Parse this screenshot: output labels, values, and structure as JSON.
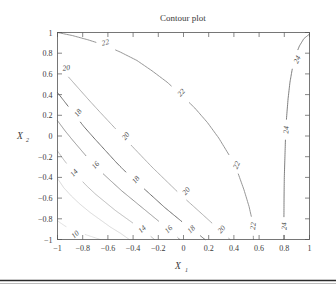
{
  "figure": {
    "title": "Contour plot",
    "background_color": "#ffffff",
    "frame_color": "#555555"
  },
  "chart_data": {
    "type": "contour",
    "title": "Contour plot",
    "xlabel": "X",
    "xlabel_sub": "1",
    "ylabel": "X",
    "ylabel_sub": "2",
    "xlim": [
      -1,
      1
    ],
    "ylim": [
      -1,
      1
    ],
    "grid": false,
    "legend": "none",
    "xticks": [
      "-1",
      "-0.8",
      "-0.6",
      "-0.4",
      "-0.2",
      "0",
      "0.2",
      "0.4",
      "0.6",
      "0.8",
      "1"
    ],
    "xtick_values": [
      -1,
      -0.8,
      -0.6,
      -0.4,
      -0.2,
      0,
      0.2,
      0.4,
      0.6,
      0.8,
      1
    ],
    "yticks": [
      "1",
      "0.8",
      "0.6",
      "0.4",
      "0.2",
      "0",
      "-0.2",
      "-0.4",
      "-0.6",
      "-0.8",
      "-1"
    ],
    "ytick_values": [
      1,
      0.8,
      0.6,
      0.4,
      0.2,
      0,
      -0.2,
      -0.4,
      -0.6,
      -0.8,
      -1
    ],
    "levels": [
      10,
      12,
      14,
      16,
      18,
      20,
      22,
      24
    ],
    "level_colors": [
      "#d8d8d8",
      "#cfcfcf",
      "#a8a8a8",
      "#8a8a8a",
      "#6e6e6e",
      "#9a9a9a",
      "#8a8a8a",
      "#707070"
    ],
    "level_widths": [
      0.8,
      0.8,
      0.8,
      0.9,
      1.0,
      0.8,
      0.9,
      0.9
    ],
    "contours": [
      {
        "level": 10,
        "label": "10",
        "points": [
          [
            -1,
            -0.82
          ],
          [
            -0.94,
            -0.87
          ],
          [
            -0.86,
            -0.92
          ],
          [
            -0.76,
            -0.96
          ],
          [
            -0.66,
            -1
          ]
        ],
        "labels": [
          {
            "text": "10",
            "x": -0.86,
            "y": -0.95,
            "angle": -42
          }
        ]
      },
      {
        "level": 12,
        "label": "12",
        "points": [
          [
            -1,
            -0.41
          ],
          [
            -0.95,
            -0.5
          ],
          [
            -0.89,
            -0.58
          ],
          [
            -0.82,
            -0.66
          ],
          [
            -0.74,
            -0.74
          ],
          [
            -0.66,
            -0.81
          ],
          [
            -0.58,
            -0.88
          ],
          [
            -0.5,
            -0.94
          ],
          [
            -0.43,
            -1
          ]
        ],
        "labels": []
      },
      {
        "level": 14,
        "label": "14",
        "points": [
          [
            -1,
            -0.145
          ],
          [
            -0.95,
            -0.23
          ],
          [
            -0.9,
            -0.31
          ],
          [
            -0.84,
            -0.39
          ],
          [
            -0.77,
            -0.48
          ],
          [
            -0.7,
            -0.56
          ],
          [
            -0.62,
            -0.64
          ],
          [
            -0.54,
            -0.72
          ],
          [
            -0.46,
            -0.79
          ],
          [
            -0.38,
            -0.86
          ],
          [
            -0.3,
            -0.93
          ],
          [
            -0.23,
            -1
          ]
        ],
        "labels": [
          {
            "text": "14",
            "x": -0.87,
            "y": -0.355,
            "angle": -48
          },
          {
            "text": "14",
            "x": -0.33,
            "y": -0.9,
            "angle": -43
          }
        ]
      },
      {
        "level": 16,
        "label": "16",
        "points": [
          [
            -1,
            0.148
          ],
          [
            -0.94,
            0.05
          ],
          [
            -0.88,
            -0.04
          ],
          [
            -0.81,
            -0.14
          ],
          [
            -0.74,
            -0.24
          ],
          [
            -0.66,
            -0.34
          ],
          [
            -0.58,
            -0.43
          ],
          [
            -0.49,
            -0.53
          ],
          [
            -0.4,
            -0.62
          ],
          [
            -0.31,
            -0.71
          ],
          [
            -0.23,
            -0.79
          ],
          [
            -0.15,
            -0.87
          ],
          [
            -0.08,
            -0.94
          ],
          [
            -0.03,
            -1
          ]
        ],
        "labels": [
          {
            "text": "16",
            "x": -0.7,
            "y": -0.28,
            "angle": -48
          },
          {
            "text": "16",
            "x": -0.12,
            "y": -0.9,
            "angle": -44
          }
        ]
      },
      {
        "level": 18,
        "label": "18",
        "points": [
          [
            -1,
            0.42
          ],
          [
            -0.93,
            0.31
          ],
          [
            -0.86,
            0.2
          ],
          [
            -0.79,
            0.09
          ],
          [
            -0.71,
            -0.02
          ],
          [
            -0.62,
            -0.14
          ],
          [
            -0.53,
            -0.26
          ],
          [
            -0.44,
            -0.37
          ],
          [
            -0.34,
            -0.48
          ],
          [
            -0.24,
            -0.59
          ],
          [
            -0.15,
            -0.69
          ],
          [
            -0.05,
            -0.79
          ],
          [
            0.04,
            -0.88
          ],
          [
            0.12,
            -0.95
          ],
          [
            0.17,
            -1
          ]
        ],
        "labels": [
          {
            "text": "18",
            "x": -0.84,
            "y": 0.225,
            "angle": -52
          },
          {
            "text": "18",
            "x": -0.38,
            "y": -0.42,
            "angle": -50
          },
          {
            "text": "18",
            "x": 0.06,
            "y": -0.9,
            "angle": -46
          }
        ]
      },
      {
        "level": 20,
        "label": "20",
        "points": [
          [
            -1,
            0.68
          ],
          [
            -0.92,
            0.58
          ],
          [
            -0.84,
            0.47
          ],
          [
            -0.76,
            0.36
          ],
          [
            -0.67,
            0.24
          ],
          [
            -0.57,
            0.11
          ],
          [
            -0.47,
            -0.02
          ],
          [
            -0.36,
            -0.16
          ],
          [
            -0.25,
            -0.3
          ],
          [
            -0.14,
            -0.43
          ],
          [
            -0.03,
            -0.56
          ],
          [
            0.08,
            -0.68
          ],
          [
            0.18,
            -0.79
          ],
          [
            0.27,
            -0.89
          ],
          [
            0.34,
            -0.97
          ],
          [
            0.37,
            -1
          ]
        ],
        "labels": [
          {
            "text": "20",
            "x": -0.93,
            "y": 0.66,
            "angle": -6
          },
          {
            "text": "20",
            "x": -0.46,
            "y": 0.0,
            "angle": -52
          },
          {
            "text": "20",
            "x": 0.02,
            "y": -0.53,
            "angle": -50
          },
          {
            "text": "20",
            "x": 0.3,
            "y": -0.9,
            "angle": -48
          }
        ]
      },
      {
        "level": 22,
        "label": "22",
        "points": [
          [
            -1,
            1.0
          ],
          [
            -0.88,
            0.97
          ],
          [
            -0.76,
            0.93
          ],
          [
            -0.63,
            0.88
          ],
          [
            -0.5,
            0.81
          ],
          [
            -0.37,
            0.73
          ],
          [
            -0.25,
            0.63
          ],
          [
            -0.13,
            0.52
          ],
          [
            -0.02,
            0.4
          ],
          [
            0.09,
            0.27
          ],
          [
            0.19,
            0.13
          ],
          [
            0.28,
            -0.02
          ],
          [
            0.36,
            -0.18
          ],
          [
            0.43,
            -0.35
          ],
          [
            0.48,
            -0.52
          ],
          [
            0.52,
            -0.68
          ],
          [
            0.55,
            -0.84
          ],
          [
            0.555,
            -1
          ]
        ],
        "labels": [
          {
            "text": "22",
            "x": -0.62,
            "y": 0.905,
            "angle": -14
          },
          {
            "text": "22",
            "x": -0.02,
            "y": 0.42,
            "angle": -48
          },
          {
            "text": "22",
            "x": 0.42,
            "y": -0.28,
            "angle": -67
          },
          {
            "text": "22",
            "x": 0.55,
            "y": -0.87,
            "angle": -85
          }
        ]
      },
      {
        "level": 24,
        "label": "24",
        "points": [
          [
            1.0,
            0.985
          ],
          [
            0.955,
            0.94
          ],
          [
            0.92,
            0.87
          ],
          [
            0.89,
            0.78
          ],
          [
            0.865,
            0.66
          ],
          [
            0.845,
            0.52
          ],
          [
            0.83,
            0.36
          ],
          [
            0.818,
            0.18
          ],
          [
            0.81,
            0.0
          ],
          [
            0.805,
            -0.2
          ],
          [
            0.8,
            -0.4
          ],
          [
            0.798,
            -0.6
          ],
          [
            0.797,
            -0.8
          ],
          [
            0.796,
            -1
          ]
        ],
        "labels": [
          {
            "text": "24",
            "x": 0.9,
            "y": 0.74,
            "angle": -65
          },
          {
            "text": "24",
            "x": 0.812,
            "y": 0.06,
            "angle": -86
          },
          {
            "text": "24",
            "x": 0.797,
            "y": -0.87,
            "angle": -88
          }
        ]
      }
    ]
  }
}
